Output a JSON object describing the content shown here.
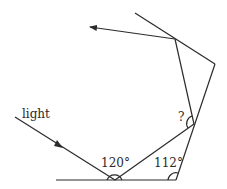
{
  "diagram": {
    "labels": {
      "light": "light",
      "angle_a": "120°",
      "angle_b": "112°",
      "unknown": "?"
    },
    "colors": {
      "stroke": "#2a2a2a",
      "background": "#ffffff"
    }
  }
}
